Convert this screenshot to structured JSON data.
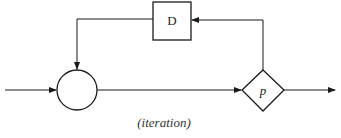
{
  "diagram": {
    "caption": "(iteration)",
    "colors": {
      "stroke": "#1a1a1a",
      "background": "#ffffff"
    },
    "nodes": [
      {
        "id": "junction",
        "shape": "circle",
        "label": ""
      },
      {
        "id": "delay",
        "shape": "rectangle",
        "label": "D"
      },
      {
        "id": "predicate",
        "shape": "diamond",
        "label": "p"
      }
    ],
    "edges": [
      {
        "from": "input",
        "to": "junction"
      },
      {
        "from": "junction",
        "to": "predicate"
      },
      {
        "from": "predicate",
        "to": "output"
      },
      {
        "from": "predicate",
        "to": "delay"
      },
      {
        "from": "delay",
        "to": "junction"
      }
    ]
  }
}
